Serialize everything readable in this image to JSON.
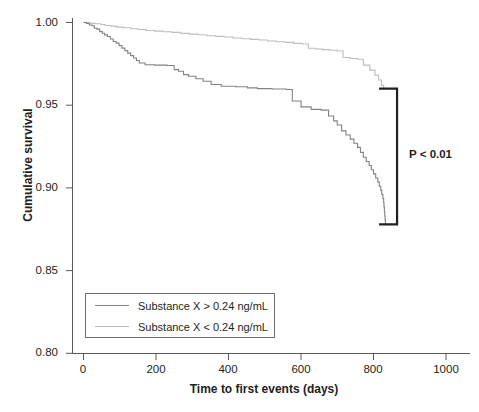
{
  "chart_data": {
    "type": "line",
    "subtype": "kaplan-meier-step",
    "title": "",
    "xlabel": "Time to first events (days)",
    "ylabel": "Cumulative survival",
    "xlim": [
      -30,
      1030
    ],
    "ylim": [
      0.8,
      1.005
    ],
    "xticks": [
      0,
      200,
      400,
      600,
      800,
      1000
    ],
    "xtick_labels": [
      "0",
      "200",
      "400",
      "600",
      "800",
      "1000"
    ],
    "yticks": [
      0.8,
      0.85,
      0.9,
      0.95,
      1.0
    ],
    "ytick_labels": [
      "0.80",
      "0.85",
      "0.90",
      "0.95",
      "1.00"
    ],
    "grid": false,
    "legend_position": "lower-left-inside",
    "series": [
      {
        "name": "Substance X > 0.24 ng/mL",
        "color": "#808285",
        "points": [
          [
            0,
            1.0
          ],
          [
            8,
            0.9995
          ],
          [
            16,
            0.9985
          ],
          [
            24,
            0.998
          ],
          [
            30,
            0.9965
          ],
          [
            38,
            0.996
          ],
          [
            45,
            0.9945
          ],
          [
            52,
            0.9935
          ],
          [
            58,
            0.9925
          ],
          [
            66,
            0.9915
          ],
          [
            74,
            0.99
          ],
          [
            82,
            0.9885
          ],
          [
            90,
            0.9875
          ],
          [
            98,
            0.986
          ],
          [
            106,
            0.9845
          ],
          [
            114,
            0.983
          ],
          [
            122,
            0.9815
          ],
          [
            130,
            0.98
          ],
          [
            138,
            0.9785
          ],
          [
            146,
            0.977
          ],
          [
            154,
            0.9755
          ],
          [
            170,
            0.9745
          ],
          [
            196,
            0.9742
          ],
          [
            230,
            0.974
          ],
          [
            250,
            0.9715
          ],
          [
            262,
            0.9705
          ],
          [
            276,
            0.9685
          ],
          [
            290,
            0.9675
          ],
          [
            310,
            0.966
          ],
          [
            330,
            0.9645
          ],
          [
            352,
            0.9625
          ],
          [
            380,
            0.9615
          ],
          [
            420,
            0.9612
          ],
          [
            452,
            0.9605
          ],
          [
            480,
            0.96
          ],
          [
            520,
            0.9598
          ],
          [
            560,
            0.9595
          ],
          [
            576,
            0.9525
          ],
          [
            600,
            0.949
          ],
          [
            628,
            0.9475
          ],
          [
            656,
            0.947
          ],
          [
            676,
            0.9435
          ],
          [
            690,
            0.9405
          ],
          [
            700,
            0.938
          ],
          [
            712,
            0.9345
          ],
          [
            724,
            0.932
          ],
          [
            736,
            0.9295
          ],
          [
            746,
            0.927
          ],
          [
            756,
            0.9245
          ],
          [
            764,
            0.9215
          ],
          [
            772,
            0.9185
          ],
          [
            780,
            0.916
          ],
          [
            788,
            0.9135
          ],
          [
            794,
            0.911
          ],
          [
            800,
            0.9085
          ],
          [
            806,
            0.906
          ],
          [
            812,
            0.9035
          ],
          [
            816,
            0.901
          ],
          [
            820,
            0.8985
          ],
          [
            823,
            0.896
          ],
          [
            826,
            0.8935
          ],
          [
            828,
            0.891
          ],
          [
            829,
            0.8885
          ],
          [
            830,
            0.8855
          ],
          [
            831,
            0.883
          ],
          [
            832,
            0.8805
          ],
          [
            833,
            0.878
          ]
        ]
      },
      {
        "name": "Substance X < 0.24 ng/mL",
        "color": "#bcbec0",
        "points": [
          [
            0,
            1.0
          ],
          [
            10,
            0.9998
          ],
          [
            22,
            0.9995
          ],
          [
            34,
            0.9992
          ],
          [
            48,
            0.9988
          ],
          [
            60,
            0.9982
          ],
          [
            76,
            0.9978
          ],
          [
            92,
            0.9972
          ],
          [
            110,
            0.9968
          ],
          [
            130,
            0.9962
          ],
          [
            150,
            0.9958
          ],
          [
            172,
            0.9952
          ],
          [
            196,
            0.9948
          ],
          [
            220,
            0.9944
          ],
          [
            244,
            0.994
          ],
          [
            268,
            0.9934
          ],
          [
            292,
            0.993
          ],
          [
            316,
            0.9926
          ],
          [
            340,
            0.992
          ],
          [
            364,
            0.9916
          ],
          [
            388,
            0.9912
          ],
          [
            412,
            0.9906
          ],
          [
            436,
            0.9902
          ],
          [
            460,
            0.9898
          ],
          [
            484,
            0.9894
          ],
          [
            508,
            0.9888
          ],
          [
            532,
            0.9884
          ],
          [
            556,
            0.988
          ],
          [
            580,
            0.9874
          ],
          [
            604,
            0.987
          ],
          [
            620,
            0.9844
          ],
          [
            640,
            0.984
          ],
          [
            660,
            0.9836
          ],
          [
            680,
            0.9832
          ],
          [
            700,
            0.9828
          ],
          [
            716,
            0.9788
          ],
          [
            736,
            0.9782
          ],
          [
            756,
            0.9778
          ],
          [
            772,
            0.9742
          ],
          [
            790,
            0.9712
          ],
          [
            804,
            0.9682
          ],
          [
            814,
            0.9652
          ],
          [
            822,
            0.962
          ],
          [
            828,
            0.96
          ],
          [
            833,
            0.96
          ]
        ]
      }
    ],
    "annotations": [
      {
        "name": "significance-bracket",
        "text": "P < 0.01",
        "x_days": 865,
        "y_top": 0.96,
        "y_bottom": 0.878
      }
    ]
  },
  "axes": {
    "y_title": "Cumulative survival",
    "x_title": "Time to first events (days)",
    "x_tick_labels": [
      "0",
      "200",
      "400",
      "600",
      "800",
      "1000"
    ],
    "y_tick_labels": [
      "1.00",
      "0.95",
      "0.90",
      "0.85",
      "0.80"
    ]
  },
  "legend": {
    "entries": [
      {
        "label": "Substance X > 0.24 ng/mL",
        "color": "#808285"
      },
      {
        "label": "Substance X < 0.24 ng/mL",
        "color": "#bcbec0"
      }
    ]
  },
  "annotation": {
    "pvalue_text": "P < 0.01"
  },
  "colors": {
    "axis": "#58595b",
    "text": "#231f20",
    "bracket": "#231f20",
    "series_high": "#808285",
    "series_low": "#bcbec0",
    "background": "#ffffff"
  }
}
